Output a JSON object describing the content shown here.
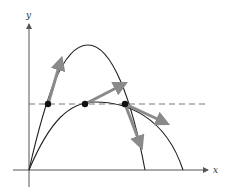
{
  "axes": {
    "x_label": "x",
    "y_label": "y"
  },
  "colors": {
    "curve": "#222222",
    "axis": "#555555",
    "arrow": "#8a8a8a",
    "dashed": "#666666",
    "point": "#111111"
  },
  "curves": [
    {
      "name": "tall-trajectory",
      "start": [
        29,
        170
      ],
      "peak": [
        88,
        45
      ],
      "end": [
        145,
        170
      ]
    },
    {
      "name": "wide-trajectory",
      "start": [
        29,
        170
      ],
      "peak": [
        95,
        102
      ],
      "end": [
        183,
        170
      ]
    }
  ],
  "reference_line": {
    "style": "dashed",
    "y": 104
  },
  "points": [
    {
      "x": 48,
      "y": 104
    },
    {
      "x": 85,
      "y": 104
    },
    {
      "x": 125,
      "y": 104
    }
  ],
  "velocity_arrows": [
    {
      "from": [
        48,
        104
      ],
      "to": [
        62,
        56
      ]
    },
    {
      "from": [
        85,
        104
      ],
      "to": [
        128,
        82
      ]
    },
    {
      "from": [
        125,
        104
      ],
      "to": [
        170,
        125
      ]
    },
    {
      "from": [
        125,
        104
      ],
      "to": [
        143,
        150
      ]
    }
  ]
}
